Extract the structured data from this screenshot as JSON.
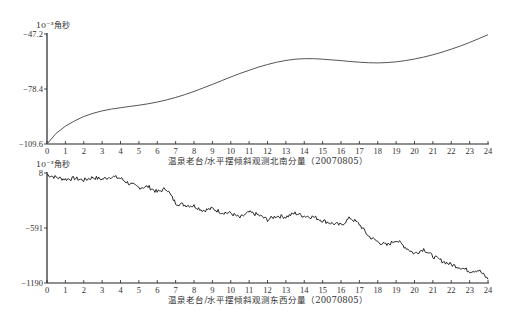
{
  "chart_data": [
    {
      "type": "line",
      "title": "温泉老台/水平摆倾斜观测北南分量（20070805）",
      "xlabel": "温泉老台/水平摆倾斜观测北南分量（20070805）",
      "ylabel": "10⁻³角秒",
      "xlim": [
        0,
        24
      ],
      "ylim": [
        -109.6,
        -47.2
      ],
      "x_ticks": [
        "0",
        "1",
        "2",
        "3",
        "4",
        "5",
        "6",
        "7",
        "8",
        "9",
        "10",
        "11",
        "12",
        "13",
        "14",
        "15",
        "16",
        "17",
        "18",
        "19",
        "20",
        "21",
        "22",
        "23",
        "24"
      ],
      "y_ticks": [
        -47.2,
        -78.4,
        -109.6
      ],
      "y_tick_labels": [
        "-47.2",
        "-78.4",
        "-109.6"
      ],
      "grid": false,
      "legend": "none",
      "series": [
        {
          "name": "北南分量",
          "x": [
            0,
            0.5,
            1,
            1.5,
            2,
            2.5,
            3,
            3.5,
            4,
            4.5,
            5,
            5.5,
            6,
            6.5,
            7,
            7.5,
            8,
            8.5,
            9,
            9.5,
            10,
            10.5,
            11,
            11.5,
            12,
            12.5,
            13,
            13.5,
            14,
            14.5,
            15,
            15.5,
            16,
            16.5,
            17,
            17.5,
            18,
            18.5,
            19,
            19.5,
            20,
            20.5,
            21,
            21.5,
            22,
            22.5,
            23,
            23.5,
            24
          ],
          "y": [
            -109.6,
            -103.5,
            -99.5,
            -96.5,
            -94.0,
            -92.2,
            -90.8,
            -89.8,
            -89.0,
            -88.3,
            -87.6,
            -86.8,
            -85.8,
            -84.6,
            -83.2,
            -81.6,
            -79.8,
            -77.8,
            -75.8,
            -73.7,
            -71.6,
            -69.6,
            -67.8,
            -66.0,
            -64.5,
            -63.2,
            -62.2,
            -61.5,
            -61.2,
            -61.2,
            -61.5,
            -61.9,
            -62.3,
            -62.8,
            -63.2,
            -63.5,
            -63.6,
            -63.4,
            -63.0,
            -62.3,
            -61.4,
            -60.3,
            -59.0,
            -57.5,
            -55.8,
            -54.0,
            -52.0,
            -49.8,
            -47.6
          ]
        }
      ]
    },
    {
      "type": "line",
      "title": "温泉老台/水平摆倾斜观测东西分量（20070805）",
      "xlabel": "温泉老台/水平摆倾斜观测东西分量（20070805）",
      "ylabel": "10⁻³角秒",
      "xlim": [
        0,
        24
      ],
      "ylim": [
        -1190,
        8
      ],
      "x_ticks": [
        "0",
        "1",
        "2",
        "3",
        "4",
        "5",
        "6",
        "7",
        "8",
        "9",
        "10",
        "11",
        "12",
        "13",
        "14",
        "15",
        "16",
        "17",
        "18",
        "19",
        "20",
        "21",
        "22",
        "23",
        "24"
      ],
      "y_ticks": [
        8,
        -591,
        -1190
      ],
      "y_tick_labels": [
        "8",
        "-591",
        "-1190"
      ],
      "grid": false,
      "legend": "none",
      "series": [
        {
          "name": "东西分量",
          "x": [
            0,
            0.5,
            1,
            1.5,
            2,
            2.5,
            3,
            3.5,
            4,
            4.5,
            5,
            5.5,
            6,
            6.5,
            7,
            7.5,
            8,
            8.5,
            9,
            9.5,
            10,
            10.5,
            11,
            11.5,
            12,
            12.5,
            13,
            13.5,
            14,
            14.5,
            15,
            15.5,
            16,
            16.5,
            17,
            17.5,
            18,
            18.5,
            19,
            19.5,
            20,
            20.5,
            21,
            21.5,
            22,
            22.5,
            23,
            23.5,
            24
          ],
          "y": [
            -10,
            -40,
            -60,
            -50,
            -70,
            -40,
            -60,
            -30,
            -50,
            -110,
            -150,
            -140,
            -200,
            -160,
            -320,
            -340,
            -350,
            -400,
            -380,
            -420,
            -430,
            -480,
            -420,
            -450,
            -500,
            -460,
            -470,
            -430,
            -460,
            -470,
            -510,
            -540,
            -560,
            -480,
            -550,
            -680,
            -740,
            -780,
            -720,
            -800,
            -870,
            -820,
            -900,
            -950,
            -990,
            -1020,
            -1060,
            -1050,
            -1150
          ]
        }
      ]
    }
  ]
}
